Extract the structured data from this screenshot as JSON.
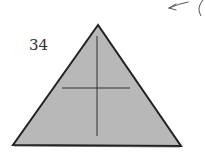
{
  "diagram": {
    "type": "origami-step",
    "step_number": "34",
    "shape": "triangle",
    "fill_color": "#b8b8b8",
    "edge_color": "#222222",
    "crease_color": "#333333",
    "background_color": "#ffffff",
    "creases": [
      "vertical-center",
      "horizontal-mid"
    ],
    "annotations": [
      "arrow-pointing-left",
      "partial-circle-next-step"
    ]
  }
}
